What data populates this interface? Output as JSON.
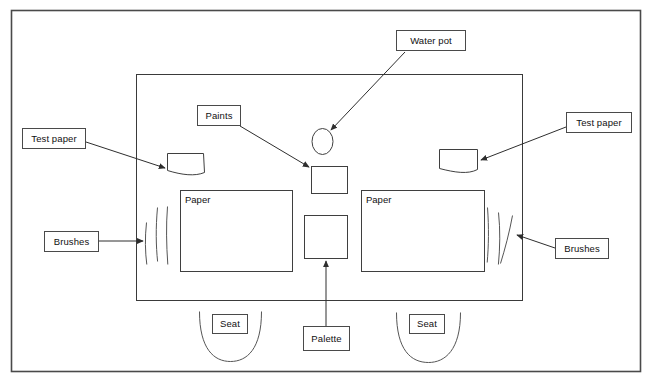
{
  "diagram": {
    "colors": {
      "stroke": "#3a3a3a",
      "frame": "#4a4a4a",
      "background": "#ffffff",
      "text": "#111111"
    },
    "labels": {
      "water_pot": "Water pot",
      "paints": "Paints",
      "test_paper_left": "Test paper",
      "test_paper_right": "Test paper",
      "brushes_left": "Brushes",
      "brushes_right": "Brushes",
      "palette": "Palette",
      "seat_left": "Seat",
      "seat_right": "Seat",
      "paper_left": "Paper",
      "paper_right": "Paper"
    },
    "callouts": [
      {
        "label": "Water pot",
        "target": "water-pot-ellipse"
      },
      {
        "label": "Paints",
        "target": "paints-square"
      },
      {
        "label": "Test paper",
        "target": "test-paper-left-shape"
      },
      {
        "label": "Test paper",
        "target": "test-paper-right-shape"
      },
      {
        "label": "Brushes",
        "target": "brushes-left-group"
      },
      {
        "label": "Brushes",
        "target": "brushes-right-group"
      },
      {
        "label": "Palette",
        "target": "palette-square"
      }
    ],
    "objects": [
      "outer-frame",
      "table-rectangle",
      "paper-left-rectangle",
      "paper-right-rectangle",
      "paints-square",
      "palette-square",
      "water-pot-ellipse",
      "test-paper-left-shape",
      "test-paper-right-shape",
      "brushes-left-group",
      "brushes-right-group",
      "seat-left-arc",
      "seat-right-arc"
    ]
  }
}
